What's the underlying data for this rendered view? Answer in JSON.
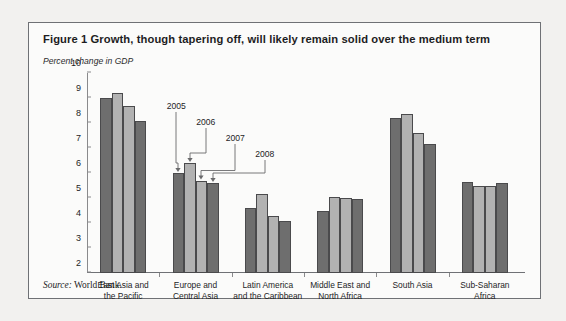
{
  "figure": {
    "title": "Figure 1  Growth, though tapering off, will likely remain solid over the medium term",
    "axis_unit_label": "Percent change in GDP",
    "source_prefix": "Source:",
    "source_text": "World Bank."
  },
  "colors": {
    "page_background": "#f2f1ef",
    "figure_background": "#fbfbfa",
    "border": "#6f7175",
    "bar_dark": "#6e6e6e",
    "bar_light": "#b2b2b2",
    "bar_outline": "#4a4a4c",
    "text": "#1d1d1f"
  },
  "callouts": [
    {
      "label": "2005",
      "group": 1,
      "bar": 0
    },
    {
      "label": "2006",
      "group": 1,
      "bar": 1
    },
    {
      "label": "2007",
      "group": 1,
      "bar": 2
    },
    {
      "label": "2008",
      "group": 1,
      "bar": 3
    }
  ],
  "chart_data": {
    "type": "bar",
    "title": "Figure 1  Growth, though tapering off, will likely remain solid over the medium term",
    "xlabel": "",
    "ylabel": "Percent change in GDP",
    "ylim": [
      2,
      10
    ],
    "yticks": [
      2,
      3,
      4,
      5,
      6,
      7,
      8,
      9,
      10
    ],
    "grid": false,
    "legend": "none",
    "categories": [
      "East Asia and the Pacific",
      "Europe and Central Asia",
      "Latin America and the Caribbean",
      "Middle East and North Africa",
      "South Asia",
      "Sub-Saharan Africa"
    ],
    "category_lines": [
      [
        "East Asia and",
        "the Pacific"
      ],
      [
        "Europe and",
        "Central Asia"
      ],
      [
        "Latin America",
        "and the Caribbean"
      ],
      [
        "Middle East and",
        "North Africa"
      ],
      [
        "South Asia"
      ],
      [
        "Sub-Saharan",
        "Africa"
      ]
    ],
    "series": [
      {
        "name": "2005",
        "shade": "dark",
        "values": [
          9.0,
          6.0,
          4.6,
          4.5,
          8.2,
          5.65
        ]
      },
      {
        "name": "2006",
        "shade": "light",
        "values": [
          9.2,
          6.4,
          5.15,
          5.05,
          8.35,
          5.5
        ]
      },
      {
        "name": "2007",
        "shade": "light",
        "values": [
          8.7,
          5.7,
          4.3,
          5.0,
          7.6,
          5.5
        ]
      },
      {
        "name": "2008",
        "shade": "dark",
        "values": [
          8.1,
          5.6,
          4.1,
          4.95,
          7.15,
          5.6
        ]
      }
    ]
  }
}
